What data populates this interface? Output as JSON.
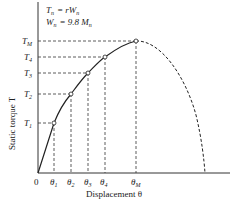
{
  "diagram": {
    "type": "torque-displacement curve",
    "formula_lines": [
      {
        "lhs": "T",
        "lhs_sub": "n",
        "rhs": "= rW",
        "rhs_sub": "n"
      },
      {
        "lhs": "W",
        "lhs_sub": "n",
        "rhs": "= 9.8 M",
        "rhs_sub": "n"
      }
    ],
    "y_axis_label": "Static torque T",
    "x_axis_label": "Displacement θ",
    "origin_label": "0",
    "y_ticks": [
      {
        "base": "T",
        "sub": "1"
      },
      {
        "base": "T",
        "sub": "2"
      },
      {
        "base": "T",
        "sub": "3"
      },
      {
        "base": "T",
        "sub": "4"
      },
      {
        "base": "T",
        "sub": "M"
      }
    ],
    "x_ticks": [
      {
        "base": "θ",
        "sub": "1"
      },
      {
        "base": "θ",
        "sub": "2"
      },
      {
        "base": "θ",
        "sub": "3"
      },
      {
        "base": "θ",
        "sub": "4"
      },
      {
        "base": "θ",
        "sub": "M"
      }
    ],
    "curve": {
      "solid_segment": "0 → θM (rising)",
      "dashed_segment": "θM → beyond (falling to zero)"
    },
    "colors": {
      "line": "#222222",
      "background": "#ffffff"
    }
  }
}
